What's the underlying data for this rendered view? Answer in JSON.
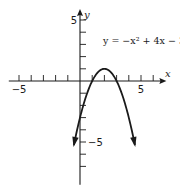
{
  "chart_data": {
    "type": "line",
    "title": "",
    "equation_label": "y = −x² + 4x − 3",
    "xlabel": "x",
    "ylabel": "y",
    "xlim": [
      -6,
      7
    ],
    "ylim": [
      -8.5,
      6
    ],
    "x_tick_step": 1,
    "y_tick_step": 1,
    "x_tick_labels": [
      {
        "value": -5,
        "text": "−5"
      },
      {
        "value": 5,
        "text": "5"
      }
    ],
    "y_tick_labels": [
      {
        "value": 5,
        "text": "5"
      },
      {
        "value": -5,
        "text": "−5"
      }
    ],
    "grid": false,
    "series": [
      {
        "name": "y = -x^2 + 4x - 3",
        "function": {
          "a": -1,
          "b": 4,
          "c": -3
        },
        "x_range": [
          -0.5,
          4.5
        ],
        "vertex": [
          2,
          1
        ],
        "roots": [
          1,
          3
        ],
        "y_intercept": -3,
        "arrows_at_ends": true
      }
    ]
  }
}
